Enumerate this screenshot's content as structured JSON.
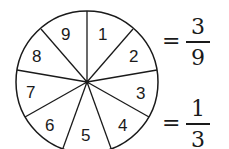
{
  "diagram": {
    "type": "spinner",
    "segments": 9,
    "labels": [
      "1",
      "2",
      "3",
      "4",
      "5",
      "6",
      "7",
      "8",
      "9"
    ],
    "stroke_color": "#1a1a1a",
    "fill_color": "#ffffff"
  },
  "equations": [
    {
      "equals": "=",
      "numerator": "3",
      "denominator": "9"
    },
    {
      "equals": "=",
      "numerator": "1",
      "denominator": "3"
    }
  ]
}
